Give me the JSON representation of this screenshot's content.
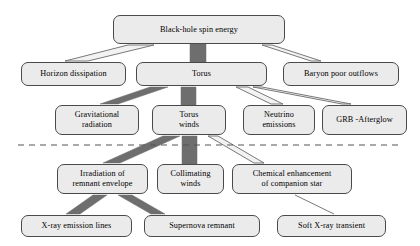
{
  "diagram": {
    "type": "flow-hierarchy",
    "colors": {
      "box_fill": "#ebebeb",
      "box_border": "#4a4a4a",
      "strong_connector": "#6e6e6e",
      "weak_connector_fill": "#f2f2f2",
      "weak_connector_stroke": "#6a6a6a",
      "divider": "#555555",
      "background": "#ffffff"
    },
    "divider": {
      "name": "dashed-separator",
      "style": "dashed",
      "x1": 18,
      "x2": 402,
      "y": 145
    },
    "levels": [
      {
        "level": 1,
        "nodes": [
          {
            "id": "black-hole-spin-energy",
            "label": "Black-hole spin energy",
            "x": 113,
            "y": 15,
            "w": 172,
            "h": 29
          }
        ]
      },
      {
        "level": 2,
        "nodes": [
          {
            "id": "horizon-dissipation",
            "label": "Horizon dissipation",
            "x": 21,
            "y": 62,
            "w": 105,
            "h": 24
          },
          {
            "id": "torus",
            "label": "Torus",
            "x": 136,
            "y": 62,
            "w": 131,
            "h": 24
          },
          {
            "id": "baryon-poor-outflows",
            "label": "Baryon poor outflows",
            "x": 283,
            "y": 62,
            "w": 116,
            "h": 24
          }
        ]
      },
      {
        "level": 3,
        "nodes": [
          {
            "id": "gravitational-radiation",
            "label": "Gravitational\nradiation",
            "x": 55,
            "y": 105,
            "w": 84,
            "h": 30
          },
          {
            "id": "torus-winds",
            "label": "Torus\nwinds",
            "x": 152,
            "y": 105,
            "w": 74,
            "h": 30
          },
          {
            "id": "neutrino-emissions",
            "label": "Neutrino\nemissions",
            "x": 243,
            "y": 105,
            "w": 72,
            "h": 30
          },
          {
            "id": "grb-afterglow",
            "label": "GRB -Afterglow",
            "x": 322,
            "y": 105,
            "w": 85,
            "h": 30
          }
        ]
      },
      {
        "level": 4,
        "nodes": [
          {
            "id": "irradiation-of-remnant-envelope",
            "label": "Irradiation of\nremnant envelope",
            "x": 57,
            "y": 164,
            "w": 91,
            "h": 30
          },
          {
            "id": "collimating-winds",
            "label": "Collimating\nwinds",
            "x": 157,
            "y": 164,
            "w": 67,
            "h": 30
          },
          {
            "id": "chemical-enhancement-of-companion-star",
            "label": "Chemical enhancement\nof companion star",
            "x": 232,
            "y": 164,
            "w": 120,
            "h": 30
          }
        ]
      },
      {
        "level": 5,
        "nodes": [
          {
            "id": "x-ray-emission-lines",
            "label": "X-ray emission lines",
            "x": 21,
            "y": 215,
            "w": 111,
            "h": 22
          },
          {
            "id": "supernova-remnant",
            "label": "Supernova remnant",
            "x": 144,
            "y": 215,
            "w": 116,
            "h": 22
          },
          {
            "id": "soft-x-ray-transient",
            "label": "Soft X-ray transient",
            "x": 277,
            "y": 215,
            "w": 109,
            "h": 22
          }
        ]
      }
    ],
    "connectors": [
      {
        "id": "spin-to-horizon",
        "from": "black-hole-spin-energy",
        "to": "horizon-dissipation",
        "weight": "thin",
        "points": "128,45 154,45 88,61 65,61"
      },
      {
        "id": "spin-to-torus",
        "from": "black-hole-spin-energy",
        "to": "torus",
        "weight": "thick",
        "points": "190,44 206,44 206,62 190,62"
      },
      {
        "id": "spin-to-baryon",
        "from": "black-hole-spin-energy",
        "to": "baryon-poor-outflows",
        "weight": "thin",
        "points": "262,45 272,45 321,61 311,61"
      },
      {
        "id": "torus-to-gravitational",
        "from": "torus",
        "to": "gravitational-radiation",
        "weight": "thick",
        "points": "150,87 168,87 118,104 100,104"
      },
      {
        "id": "torus-to-torus-winds",
        "from": "torus",
        "to": "torus-winds",
        "weight": "thick",
        "points": "181,87 196,87 196,105 181,105"
      },
      {
        "id": "torus-to-neutrino",
        "from": "torus",
        "to": "neutrino-emissions",
        "weight": "thin",
        "points": "236,87 248,87 283,104 271,104"
      },
      {
        "id": "torus-to-grb",
        "from": "torus",
        "to": "grb-afterglow",
        "weight": "thin",
        "points": "253,87 262,87 351,104 342,104"
      },
      {
        "id": "torus-winds-to-irradiation",
        "from": "torus-winds",
        "to": "irradiation-of-remnant-envelope",
        "weight": "thick",
        "points": "163,136 180,136 120,163 103,163"
      },
      {
        "id": "torus-winds-to-collimating",
        "from": "torus-winds",
        "to": "collimating-winds",
        "weight": "thick",
        "points": "182,136 197,136 197,164 182,164"
      },
      {
        "id": "torus-winds-to-chemical",
        "from": "torus-winds",
        "to": "chemical-enhancement-of-companion-star",
        "weight": "thin",
        "points": "208,136 218,136 264,163 254,163"
      },
      {
        "id": "irradiation-to-x-ray-lines",
        "from": "irradiation-of-remnant-envelope",
        "to": "x-ray-emission-lines",
        "weight": "thick",
        "points": "93,195 107,195 80,214 66,214"
      },
      {
        "id": "irradiation-to-supernova",
        "from": "irradiation-of-remnant-envelope",
        "to": "supernova-remnant",
        "weight": "thick",
        "points": "118,195 132,195 165,214 151,214"
      },
      {
        "id": "chemical-to-soft-x-ray",
        "from": "chemical-enhancement-of-companion-star",
        "to": "soft-x-ray-transient",
        "weight": "hairline",
        "points": "295,195 334,214"
      }
    ]
  }
}
